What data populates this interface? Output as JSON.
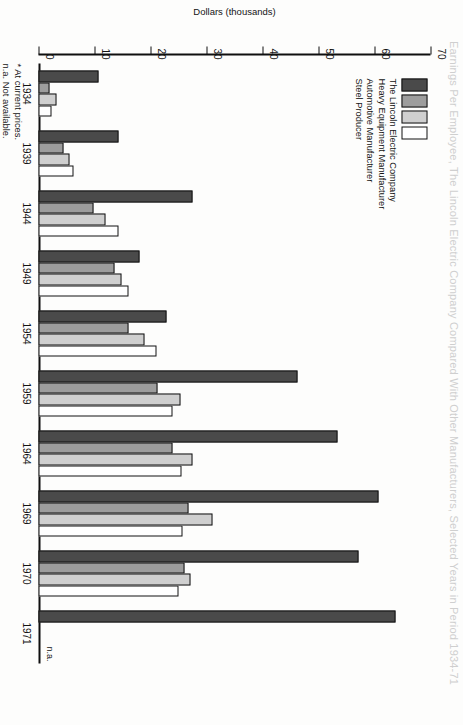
{
  "title": "Earnings Per Employee, The Lincoln Electric Company Compared With Other Manufacturers, Selected Years in Period 1934-71",
  "chart_number": "CHART III",
  "legend": {
    "items": [
      {
        "label": "The Lincoln Electric Company",
        "color": "#4a4a4a"
      },
      {
        "label": "Heavy Equipment Manufacturer",
        "color": "#9d9d9d"
      },
      {
        "label": "Automotive Manufacturer",
        "color": "#cfcfcf"
      },
      {
        "label": "Steel Producer",
        "color": "#ffffff"
      }
    ]
  },
  "footnotes": [
    "* At current prices.",
    "n.a. Not available."
  ],
  "annotations": {
    "na_1971": "n.a."
  },
  "chart_data": {
    "type": "bar",
    "orientation": "horizontal",
    "title": "Earnings Per Employee, The Lincoln Electric Company Compared With Other Manufacturers, Selected Years in Period 1934-71",
    "xlabel": "",
    "ylabel": "Dollars (thousands)",
    "ylim": [
      0,
      70
    ],
    "yticks": [
      0,
      10,
      20,
      30,
      40,
      50,
      60,
      70
    ],
    "ticklabels": [
      "0",
      "10",
      "20",
      "30",
      "40",
      "50",
      "60",
      "70"
    ],
    "grid": false,
    "legend_position": "top-left",
    "categories": [
      "1934",
      "1939",
      "1944",
      "1949",
      "1954",
      "1959",
      "1964",
      "1969",
      "1970",
      "1971"
    ],
    "series": [
      {
        "name": "The Lincoln Electric Company",
        "color": "#4a4a4a",
        "values": [
          10.8,
          14.2,
          27.5,
          18.1,
          22.9,
          46.2,
          53.4,
          60.8,
          57.2,
          63.8
        ]
      },
      {
        "name": "Heavy Equipment Manufacturer",
        "color": "#9d9d9d",
        "values": [
          2.0,
          4.5,
          9.8,
          13.5,
          16.0,
          21.2,
          24.0,
          26.8,
          26.0,
          null
        ]
      },
      {
        "name": "Automotive Manufacturer",
        "color": "#cfcfcf",
        "values": [
          3.2,
          5.6,
          11.9,
          14.8,
          19.0,
          25.4,
          27.5,
          31.0,
          27.2,
          null
        ]
      },
      {
        "name": "Steel Producer",
        "color": "#ffffff",
        "values": [
          2.4,
          6.2,
          14.2,
          16.1,
          21.0,
          24.0,
          25.6,
          25.8,
          25.0,
          null
        ]
      }
    ],
    "notes": [
      "* At current prices.",
      "n.a. Not available."
    ]
  }
}
